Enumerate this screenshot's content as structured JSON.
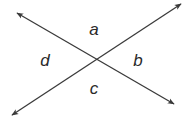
{
  "diagram": {
    "line_color": "#3a3a3a",
    "intersection": {
      "x": 96,
      "y": 59
    },
    "lines": [
      {
        "name": "line-1",
        "from": {
          "x": 17,
          "y": 13
        },
        "to": {
          "x": 174,
          "y": 104
        }
      },
      {
        "name": "line-2",
        "from": {
          "x": 12,
          "y": 115
        },
        "to": {
          "x": 181,
          "y": 4
        }
      }
    ],
    "angle_labels": {
      "top": "a",
      "right": "b",
      "bottom": "c",
      "left": "d"
    }
  }
}
